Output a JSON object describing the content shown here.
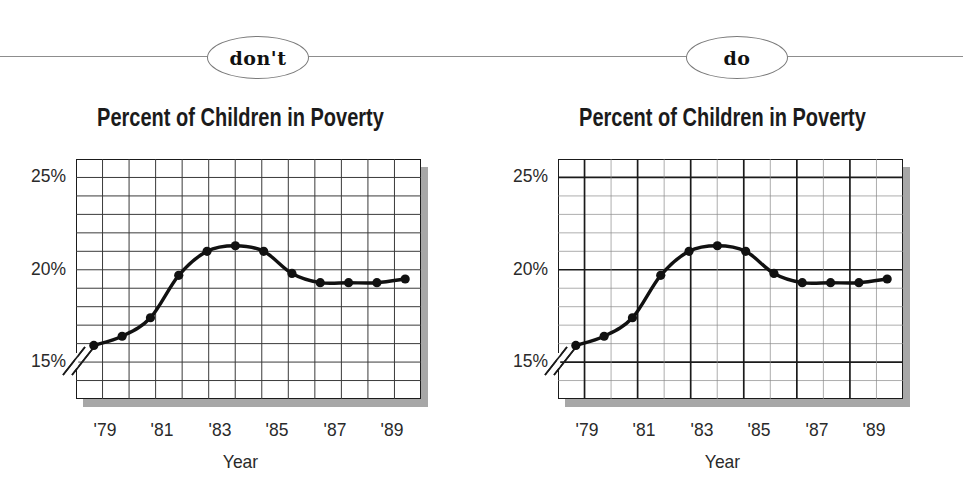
{
  "figure": {
    "badges": [
      {
        "key": "dont",
        "label": "don't"
      },
      {
        "key": "do",
        "label": "do"
      }
    ]
  },
  "chart_data": [
    {
      "id": "dont-chart",
      "variant": "uniform-grid",
      "type": "line",
      "title": "Percent of Children in Poverty",
      "xlabel": "Year",
      "ylabel": "",
      "ylim": [
        13,
        26
      ],
      "xlim": [
        1978,
        1990
      ],
      "ytick_labels": [
        "25%",
        "20%",
        "15%"
      ],
      "ytick_values": [
        25,
        20,
        15
      ],
      "xtick_labels": [
        "'79",
        "'81",
        "'83",
        "'85",
        "'87",
        "'89"
      ],
      "xtick_values": [
        1979,
        1981,
        1983,
        1985,
        1987,
        1989
      ],
      "grid": "all-gridlines-same-weight",
      "axis_break": true,
      "x": [
        1979,
        1980,
        1981,
        1982,
        1983,
        1984,
        1985,
        1986,
        1987,
        1988,
        1989
      ],
      "values": [
        15.9,
        16.4,
        17.4,
        19.7,
        21.0,
        21.3,
        21.0,
        19.8,
        19.3,
        19.3,
        19.3,
        19.5
      ],
      "series": [
        {
          "name": "Percent of children in poverty",
          "x": [
            1978.5,
            1979,
            1979.5,
            1980,
            1981,
            1981.5,
            1982,
            1983,
            1983.5,
            1984,
            1985,
            1986,
            1987,
            1988
          ],
          "values": [
            15.9,
            16.4,
            17.4,
            19.7,
            21.0,
            21.3,
            21.0,
            19.8,
            19.3,
            19.3,
            19.3,
            19.5
          ]
        }
      ]
    },
    {
      "id": "do-chart",
      "variant": "hierarchical-grid",
      "type": "line",
      "title": "Percent of Children in Poverty",
      "xlabel": "Year",
      "ylabel": "",
      "ylim": [
        13,
        26
      ],
      "xlim": [
        1978,
        1990
      ],
      "ytick_labels": [
        "25%",
        "20%",
        "15%"
      ],
      "ytick_values": [
        25,
        20,
        15
      ],
      "xtick_labels": [
        "'79",
        "'81",
        "'83",
        "'85",
        "'87",
        "'89"
      ],
      "xtick_values": [
        1979,
        1981,
        1983,
        1985,
        1987,
        1989
      ],
      "grid": "major-lines-heavy-minor-lines-light",
      "axis_break": true,
      "values": [
        15.9,
        16.4,
        17.4,
        19.7,
        21.0,
        21.3,
        21.0,
        19.8,
        19.3,
        19.3,
        19.3,
        19.5
      ],
      "series": [
        {
          "name": "Percent of children in poverty",
          "values": [
            15.9,
            16.4,
            17.4,
            19.7,
            21.0,
            21.3,
            21.0,
            19.8,
            19.3,
            19.3,
            19.3,
            19.5
          ]
        }
      ]
    }
  ],
  "colors": {
    "ink": "#1b1b1b",
    "line": "#111111",
    "minor_grid": "#8a8a8a",
    "major_grid": "#1b1b1b",
    "shadow": "#a7a7a7",
    "rule": "#8d8d8d",
    "text": "#2a2a2a"
  }
}
